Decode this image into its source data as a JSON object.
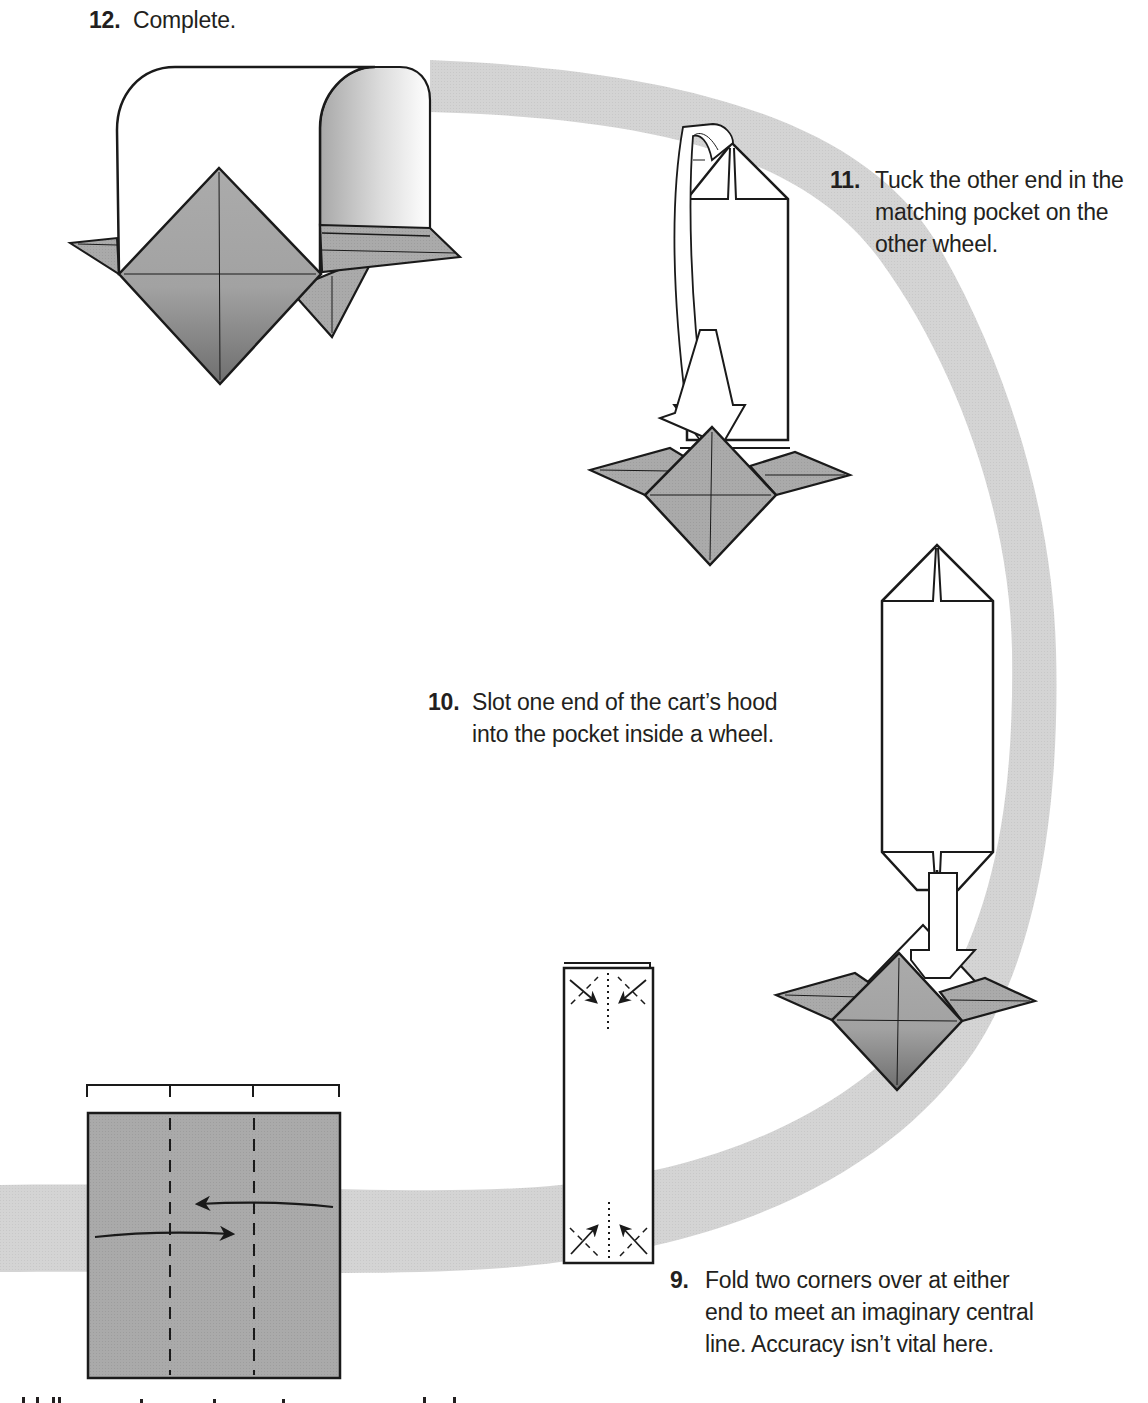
{
  "page": {
    "background": "#ffffff",
    "colors": {
      "path_band": "#d6d6d6",
      "paper_gray": "#a9a9a9",
      "paper_white": "#ffffff",
      "line": "#1a1a1a"
    }
  },
  "steps": [
    {
      "id": "step-12",
      "number": "12.",
      "lines": [
        "Complete."
      ],
      "figure": "completed-cart"
    },
    {
      "id": "step-11",
      "number": "11.",
      "lines": [
        "Tuck the other end in the",
        "matching pocket on the",
        "other wheel."
      ],
      "figure": "hood-tucked-into-second-wheel"
    },
    {
      "id": "step-10",
      "number": "10.",
      "lines": [
        "Slot one end of the cart’s hood",
        "into the pocket inside a wheel."
      ],
      "figure": "hood-slotted-into-wheel"
    },
    {
      "id": "step-9",
      "number": "9.",
      "lines": [
        "Fold two corners over at either",
        "end to meet an imaginary central",
        "line. Accuracy isn’t vital here."
      ],
      "figure": "folded-strip-with-corner-folds"
    },
    {
      "id": "step-8",
      "number": "",
      "lines": [],
      "figure": "square-folded-in-thirds",
      "note": "caption text cut off at bottom edge"
    }
  ],
  "icons": {
    "fold_arrow": "curved-arrow-icon",
    "push_arrow": "hollow-arrow-icon",
    "valley_fold": "dashed-line",
    "imaginary_line": "dotted-line"
  }
}
